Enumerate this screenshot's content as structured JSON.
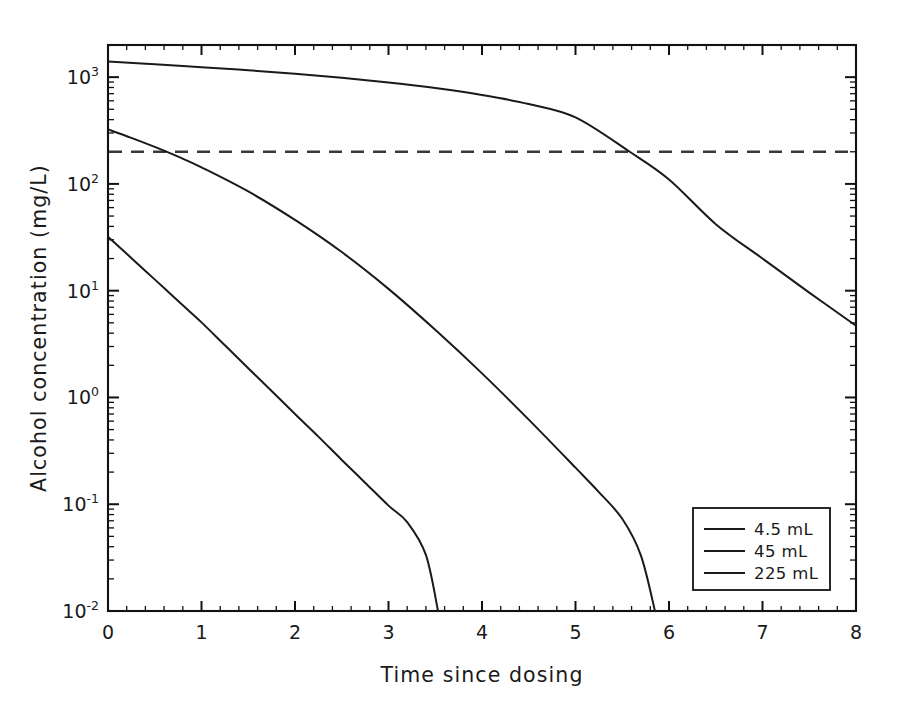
{
  "chart_data": {
    "type": "line",
    "title": "",
    "xlabel": "Time since dosing",
    "ylabel": "Alcohol concentration (mg/L)",
    "yscale": "log",
    "xscale": "linear",
    "xlim": [
      0,
      8
    ],
    "ylim": [
      0.01,
      2000
    ],
    "grid": false,
    "legend_position": "lower right",
    "x_ticks": [
      "0",
      "1",
      "2",
      "3",
      "4",
      "5",
      "6",
      "7",
      "8"
    ],
    "x_tick_values": [
      0,
      1,
      2,
      3,
      4,
      5,
      6,
      7,
      8
    ],
    "y_ticks": [
      "10⁻²",
      "10⁻¹",
      "10⁰",
      "10¹",
      "10²",
      "10³"
    ],
    "y_tick_mantissa": "10",
    "y_tick_exponents": [
      "-2",
      "-1",
      "0",
      "1",
      "2",
      "3"
    ],
    "y_tick_values": [
      0.01,
      0.1,
      1,
      10,
      100,
      1000
    ],
    "annotations": [
      {
        "name": "threshold-line",
        "kind": "horizontal-dashed-line",
        "y_value": 200,
        "label": ""
      }
    ],
    "series": [
      {
        "name": "4.5 mL",
        "legend_label": "4.5 mL",
        "color": "#1a1a1a",
        "style": "solid",
        "x": [
          0,
          0.2,
          0.4,
          0.6,
          0.8,
          1.0,
          1.25,
          1.5,
          1.75,
          2.0,
          2.25,
          2.5,
          2.75,
          3.0,
          3.2,
          3.4,
          3.53
        ],
        "y": [
          32,
          22.2,
          15.3,
          10.6,
          7.3,
          5.05,
          3.08,
          1.88,
          1.15,
          0.7,
          0.43,
          0.26,
          0.159,
          0.097,
          0.068,
          0.0335,
          0.01
        ]
      },
      {
        "name": "45 mL",
        "legend_label": "45 mL",
        "color": "#1a1a1a",
        "style": "solid",
        "x": [
          0,
          0.25,
          0.5,
          0.75,
          1.0,
          1.5,
          2.0,
          2.5,
          3.0,
          3.5,
          4.0,
          4.5,
          5.0,
          5.25,
          5.5,
          5.7,
          5.85
        ],
        "y": [
          324,
          270,
          222,
          180,
          143,
          85,
          46,
          23,
          10.4,
          4.3,
          1.68,
          0.62,
          0.22,
          0.13,
          0.073,
          0.033,
          0.01
        ]
      },
      {
        "name": "225 mL",
        "legend_label": "225 mL",
        "color": "#1a1a1a",
        "style": "solid",
        "x": [
          0,
          0.5,
          1.0,
          1.5,
          2.0,
          2.5,
          3.0,
          3.5,
          4.0,
          4.5,
          5.0,
          5.58,
          6.0,
          6.5,
          7.0,
          7.5,
          8.0
        ],
        "y": [
          1400,
          1320,
          1240,
          1160,
          1075,
          985,
          890,
          790,
          680,
          560,
          420,
          200,
          110,
          42,
          20,
          9.6,
          4.7
        ]
      }
    ],
    "notable_points": [
      {
        "series": "225 mL",
        "x": 5.58,
        "y": 200,
        "note": "crosses threshold"
      },
      {
        "series": "45 mL",
        "x": 0.78,
        "y": 200,
        "note": "crosses threshold"
      },
      {
        "series": "4.5 mL",
        "x": 3.53,
        "y": 0.01,
        "note": "reaches axis floor"
      },
      {
        "series": "45 mL",
        "x": 5.85,
        "y": 0.01,
        "note": "reaches axis floor"
      }
    ]
  }
}
